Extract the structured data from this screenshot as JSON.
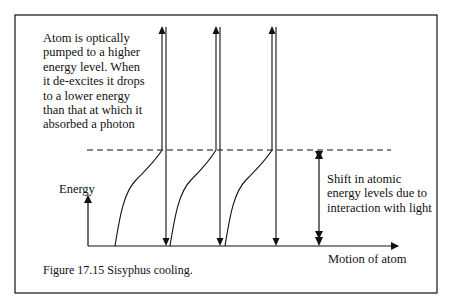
{
  "figure": {
    "caption": "Figure 17.15 Sisyphus cooling.",
    "description": "Atom is optically\npumped to a higher\nenergy level. When\nit de-excites it drops\nto a lower energy\nthan that at which it\nabsorbed a photon",
    "shift_label": "Shift in atomic\nenergy levels due to\ninteraction with light",
    "y_axis_label": "Energy",
    "x_axis_label": "Motion of atom"
  },
  "colors": {
    "line": "#111111",
    "background": "#ffffff"
  },
  "cycles": [
    {
      "start_x": 115,
      "kink_x": 162,
      "down_x": 166
    },
    {
      "start_x": 170,
      "kink_x": 216,
      "down_x": 220
    },
    {
      "start_x": 225,
      "kink_x": 272,
      "down_x": 276
    }
  ]
}
